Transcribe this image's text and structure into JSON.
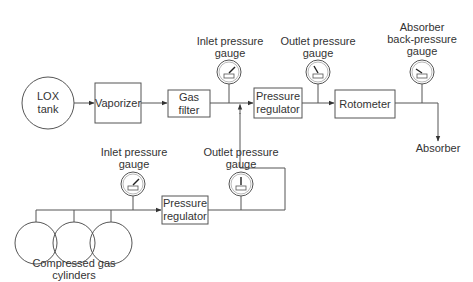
{
  "diagram": {
    "type": "flow-schematic",
    "nodes": {
      "lox_tank": {
        "line1": "LOX",
        "line2": "tank"
      },
      "vaporizer": {
        "label": "Vaporizer"
      },
      "gas_filter": {
        "line1": "Gas",
        "line2": "filter"
      },
      "top_inlet_gauge": {
        "line1": "Inlet pressure",
        "line2": "gauge"
      },
      "top_regulator": {
        "line1": "Pressure",
        "line2": "regulator"
      },
      "top_outlet_gauge": {
        "line1": "Outlet pressure",
        "line2": "gauge"
      },
      "rotometer": {
        "label": "Rotometer"
      },
      "absorber_gauge": {
        "line1": "Absorber",
        "line2": "back-pressure",
        "line3": "gauge"
      },
      "absorber": {
        "label": "Absorber"
      },
      "bottom_inlet_gauge": {
        "line1": "Inlet pressure",
        "line2": "gauge"
      },
      "bottom_regulator": {
        "line1": "Pressure",
        "line2": "regulator"
      },
      "bottom_outlet_gauge": {
        "line1": "Outlet pressure",
        "line2": "gauge"
      },
      "cylinders": {
        "line1": "Compressed gas",
        "line2": "cylinders",
        "count": 3
      }
    },
    "edges": [
      [
        "LOX tank",
        "Vaporizer"
      ],
      [
        "Vaporizer",
        "Gas filter"
      ],
      [
        "Gas filter",
        "Pressure regulator (top)"
      ],
      [
        "Pressure regulator (bottom)",
        "Pressure regulator (top)"
      ],
      [
        "Compressed gas cylinders",
        "Pressure regulator (bottom)"
      ],
      [
        "Pressure regulator (top)",
        "Rotometer"
      ],
      [
        "Rotometer",
        "Absorber"
      ]
    ]
  }
}
